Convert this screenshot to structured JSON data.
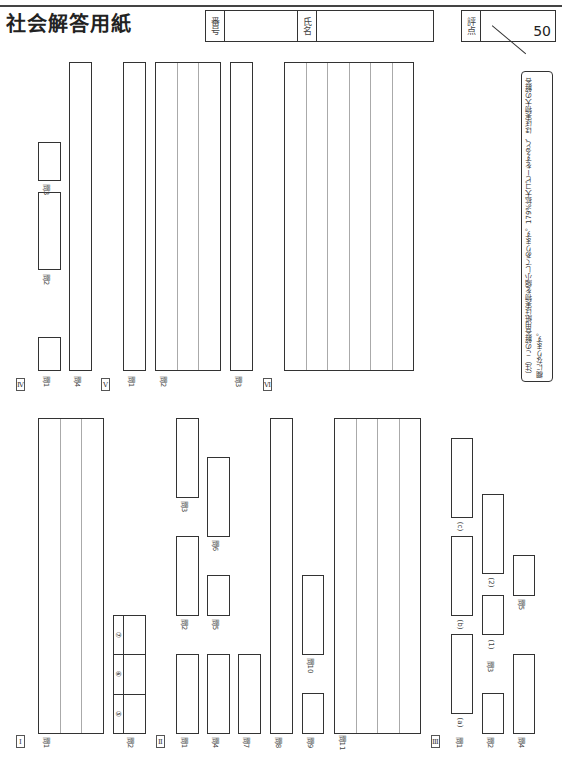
{
  "header": {
    "title": "社会解答用紙",
    "number_label": "番号",
    "name_label": "氏名",
    "score_label": "評点",
    "score_max": "50"
  },
  "note": {
    "text": "（注）この解答用紙は実物を縮小してあります。179%拡大コピーをすると、ほぼ実物大の解答欄になります。"
  },
  "sections": {
    "I": {
      "label": "Ⅰ",
      "q1": "問1",
      "q2": "問2",
      "q2_items": [
        "⑤",
        "⑥",
        "⑦"
      ]
    },
    "II": {
      "label": "Ⅱ",
      "q1": "問1",
      "q2": "問2",
      "q3": "問3",
      "q4": "問4",
      "q5": "問5",
      "q6": "問6",
      "q7": "問7",
      "q8": "問8",
      "q9": "問9",
      "q10": "問10",
      "q11": "問11"
    },
    "III": {
      "label": "Ⅲ",
      "q1": "問1",
      "q1a": "(a)",
      "q1b": "(b)",
      "q1c": "(c)",
      "q2": "問2",
      "q3": "問3",
      "q3_1": "(1)",
      "q3_2": "(2)",
      "q4": "問4",
      "q5": "問5"
    },
    "IV": {
      "label": "Ⅳ",
      "q1": "問1",
      "q2": "問2",
      "q3": "問3",
      "q4": "問4"
    },
    "V": {
      "label": "Ⅴ",
      "q1": "問1",
      "q2": "問2",
      "q3": "問3"
    },
    "VI": {
      "label": "Ⅵ"
    }
  }
}
